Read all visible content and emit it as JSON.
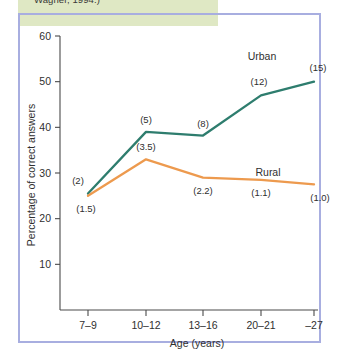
{
  "figure": {
    "caption_fragment": "Wagner, 1994.)",
    "band_color": "#dfe8c4",
    "panel_border_color": "#a8aee0"
  },
  "chart_data": {
    "type": "line",
    "title": "",
    "xlabel": "Age (years)",
    "ylabel": "Percentage of correct answers",
    "categories": [
      "7–9",
      "10–12",
      "13–16",
      "20–21",
      "–27"
    ],
    "ylim": [
      0,
      60
    ],
    "yticks": [
      10,
      20,
      30,
      40,
      50,
      60
    ],
    "ytick_labels": [
      "10",
      "20",
      "30",
      "40",
      "50",
      "60"
    ],
    "grid": false,
    "legend_position": "inline-right",
    "series": [
      {
        "name": "Urban",
        "color": "#2e7d6e",
        "values": [
          25.5,
          39.0,
          38.2,
          47.0,
          50.0
        ],
        "point_labels": [
          "(2)",
          "(5)",
          "(8)",
          "(12)",
          "(15)"
        ]
      },
      {
        "name": "Rural",
        "color": "#ed9a4e",
        "values": [
          25.0,
          33.0,
          29.0,
          28.5,
          27.5
        ],
        "point_labels": [
          "(1.5)",
          "(3.5)",
          "(2.2)",
          "(1.1)",
          "(1.0)"
        ]
      }
    ]
  }
}
